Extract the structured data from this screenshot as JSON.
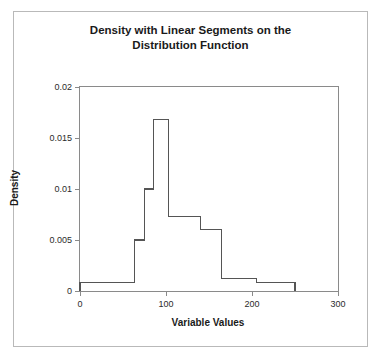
{
  "chart_data": {
    "type": "bar",
    "title": "Density with Linear Segments on the Distribution Function",
    "title_line1": "Density with Linear Segments on the",
    "title_line2": "Distribution Function",
    "xlabel": "Variable Values",
    "ylabel": "Density",
    "xlim": [
      0,
      300
    ],
    "ylim": [
      0,
      0.02
    ],
    "grid": false,
    "legend": null,
    "style": {
      "line_color": "#555555",
      "axis_color": "#8a8a8a",
      "background": "#ffffff",
      "frame_color": "#b9b9b9"
    },
    "xticks": [
      0,
      100,
      200,
      300
    ],
    "xtick_labels": [
      "0",
      "100",
      "200",
      "300"
    ],
    "yticks": [
      0,
      0.005,
      0.01,
      0.015,
      0.02
    ],
    "ytick_labels": [
      "0",
      "0.005",
      "0.01",
      "0.015",
      "0.02"
    ],
    "bin_edges": [
      0,
      63,
      75,
      85,
      103,
      140,
      165,
      205,
      250
    ],
    "values": [
      0.0008,
      0.005,
      0.01,
      0.0168,
      0.0073,
      0.006,
      0.0012,
      0.0008
    ],
    "bars": [
      {
        "x0": 0,
        "x1": 63,
        "density": 0.0008
      },
      {
        "x0": 63,
        "x1": 75,
        "density": 0.005
      },
      {
        "x0": 75,
        "x1": 85,
        "density": 0.01
      },
      {
        "x0": 85,
        "x1": 103,
        "density": 0.0168
      },
      {
        "x0": 103,
        "x1": 140,
        "density": 0.0073
      },
      {
        "x0": 140,
        "x1": 165,
        "density": 0.006
      },
      {
        "x0": 165,
        "x1": 205,
        "density": 0.0012
      },
      {
        "x0": 205,
        "x1": 250,
        "density": 0.0008
      }
    ]
  }
}
